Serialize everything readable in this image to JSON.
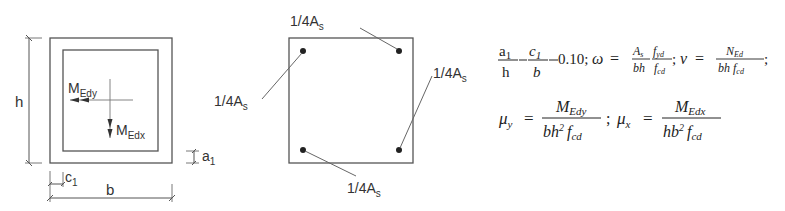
{
  "colors": {
    "line": "#555555",
    "text": "#333333",
    "bar": "#222222"
  },
  "section_geometry": {
    "dim_h_label": "h",
    "dim_b_label": "b",
    "cover_c_label": "c",
    "cover_c_sub": "1",
    "cover_a_label": "a",
    "cover_a_sub": "1",
    "moment_y_label": "M",
    "moment_y_sub": "Edy",
    "moment_x_label": "M",
    "moment_x_sub": "Edx"
  },
  "reinforcement_layout": {
    "bar_label_prefix": "1/4A",
    "bar_label_sub": "s",
    "bars": [
      {
        "position": "top-left",
        "label": "1/4As"
      },
      {
        "position": "top-right",
        "label": "1/4As"
      },
      {
        "position": "bottom-right",
        "label": "1/4As"
      },
      {
        "position": "bottom-left",
        "label": "1/4As"
      }
    ]
  },
  "formulas": {
    "ratio": {
      "a_num": "a",
      "a_sub": "1",
      "h_den": "h",
      "c_num": "c",
      "c_sub": "1",
      "b_den": "b",
      "value": "0.10;"
    },
    "omega": {
      "symbol": "ω",
      "eq": "=",
      "num_A": "A",
      "num_A_sub": "s",
      "num_f": "f",
      "num_f_sub": "yd",
      "den_bh": "bh",
      "den_f": "f",
      "den_f_sub": "cd",
      "sep": ";"
    },
    "nu": {
      "symbol": "ν",
      "eq": "=",
      "num_N": "N",
      "num_N_sub": "Ed",
      "den_bh": "bh",
      "den_f": "f",
      "den_f_sub": "cd",
      "sep": ";"
    },
    "mu_y": {
      "symbol": "μ",
      "symbol_sub": "y",
      "eq": "=",
      "num_M": "M",
      "num_M_sub": "Edy",
      "den_b": "bh",
      "den_exp": "2",
      "den_f": "f",
      "den_f_sub": "cd",
      "sep": ";"
    },
    "mu_x": {
      "symbol": "μ",
      "symbol_sub": "x",
      "eq": "=",
      "num_M": "M",
      "num_M_sub": "Edx",
      "den_b": "hb",
      "den_exp": "2",
      "den_f": "f",
      "den_f_sub": "cd"
    }
  }
}
